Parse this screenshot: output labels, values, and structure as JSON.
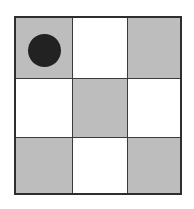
{
  "board": {
    "rows": 3,
    "cols": 3,
    "colors": {
      "dark_square": "#bdbdbd",
      "light_square": "#ffffff",
      "grid_line": "#2e2e2e",
      "piece": "#222222"
    },
    "cells": [
      [
        {
          "shade": "gray",
          "piece": "black-circle"
        },
        {
          "shade": "white",
          "piece": null
        },
        {
          "shade": "gray",
          "piece": null
        }
      ],
      [
        {
          "shade": "white",
          "piece": null
        },
        {
          "shade": "gray",
          "piece": null
        },
        {
          "shade": "white",
          "piece": null
        }
      ],
      [
        {
          "shade": "gray",
          "piece": null
        },
        {
          "shade": "white",
          "piece": null
        },
        {
          "shade": "gray",
          "piece": null
        }
      ]
    ]
  }
}
